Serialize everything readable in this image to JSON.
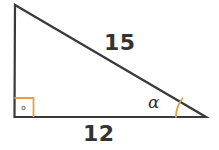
{
  "figure": {
    "kind": "right-triangle-diagram",
    "background_color": "#ffffff",
    "width": 219,
    "height": 150
  },
  "geometry": {
    "stroke_color": "#3a3a3a",
    "stroke_width": 2.2,
    "vertices": {
      "apex": {
        "x": 15,
        "y": 5
      },
      "right_angle": {
        "x": 14.5,
        "y": 117
      },
      "angle_alpha": {
        "x": 206,
        "y": 117
      }
    },
    "sides": [
      {
        "name": "vertical-leg",
        "from": "apex",
        "to": "right_angle",
        "label": ""
      },
      {
        "name": "base-leg",
        "from": "right_angle",
        "to": "angle_alpha",
        "label": "12"
      },
      {
        "name": "hypotenuse",
        "from": "apex",
        "to": "angle_alpha",
        "label": "15"
      }
    ]
  },
  "markers": {
    "right_angle": {
      "color": "#E3A04B",
      "stroke_width": 1.8,
      "size": 19,
      "dot_color": "#8a8a8a",
      "dot_radius": 1.6
    },
    "alpha_arc": {
      "color": "#E3A04B",
      "stroke_width": 1.8,
      "radius": 30
    }
  },
  "labels": {
    "hypotenuse": "15",
    "base": "12",
    "angle": "α"
  }
}
